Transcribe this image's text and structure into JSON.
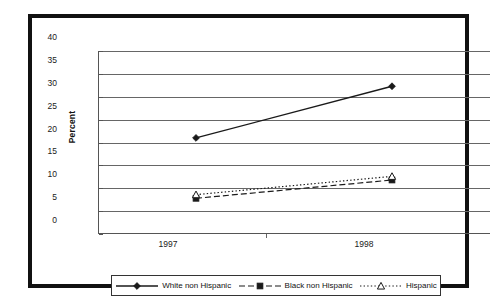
{
  "chart_data": {
    "type": "line",
    "title": "",
    "xlabel": "",
    "ylabel": "Percent",
    "categories": [
      "1997",
      "1998"
    ],
    "x": [
      1997,
      1998
    ],
    "ylim": [
      0,
      40
    ],
    "yticks": [
      0,
      5,
      10,
      15,
      20,
      25,
      30,
      35,
      40
    ],
    "ytick_labels": [
      "0",
      "5",
      "10",
      "15",
      "20",
      "25",
      "30",
      "35",
      "40"
    ],
    "grid": true,
    "legend_position": "bottom",
    "series": [
      {
        "name": "White non Hispanic",
        "values": [
          21.0,
          32.3
        ],
        "marker": "diamond",
        "line_style": "solid",
        "color": "#1a1a1a"
      },
      {
        "name": "Black non Hispanic",
        "values": [
          7.8,
          11.8
        ],
        "marker": "square",
        "line_style": "dashed",
        "color": "#1a1a1a"
      },
      {
        "name": "Hispanic",
        "values": [
          8.6,
          12.6
        ],
        "marker": "triangle",
        "line_style": "dotted",
        "color": "#1a1a1a"
      }
    ]
  },
  "legend": {
    "entries": [
      {
        "label": "White non Hispanic",
        "marker": "diamond-marker-icon",
        "line_style": "solid"
      },
      {
        "label": "Black non Hispanic",
        "marker": "square-marker-icon",
        "line_style": "dashed"
      },
      {
        "label": "Hispanic",
        "marker": "triangle-marker-icon",
        "line_style": "dotted"
      }
    ]
  },
  "axes": {
    "y_label": "Percent",
    "y_ticks": [
      "40",
      "35",
      "30",
      "25",
      "20",
      "15",
      "10",
      "5",
      "0"
    ],
    "x_ticks": [
      "1997",
      "1998"
    ]
  },
  "colors": {
    "frame": "#111111",
    "gridline": "#666666",
    "series": "#1a1a1a",
    "background": "#ffffff"
  }
}
